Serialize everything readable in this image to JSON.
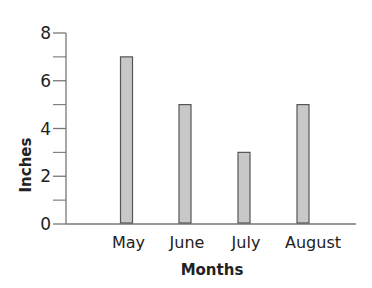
{
  "chart_data": {
    "type": "bar",
    "title": "",
    "xlabel": "Months",
    "ylabel": "Inches",
    "categories": [
      "May",
      "June",
      "July",
      "August"
    ],
    "values": [
      7,
      5,
      3,
      5
    ],
    "ylim": [
      0,
      8
    ],
    "yticks_labeled": [
      0,
      2,
      4,
      6,
      8
    ],
    "yticks_minor": [
      1,
      3,
      5,
      7
    ],
    "grid": false,
    "legend": null,
    "colors": {
      "bar_fill": "#c8c8c8",
      "bar_stroke": "#555555",
      "axis": "#777777",
      "text": "#222222"
    }
  }
}
